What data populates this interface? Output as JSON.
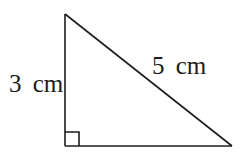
{
  "figure": {
    "type": "right-triangle-diagram",
    "side_labels": {
      "vertical": "3 cm",
      "hypotenuse": "5 cm"
    },
    "values": {
      "vertical_side_cm": 3,
      "hypotenuse_cm": 5
    },
    "markers": {
      "right_angle": "square-at-bottom-left-corner"
    },
    "colors": {
      "stroke": "#1c1c1c",
      "background": "#ffffff"
    }
  }
}
